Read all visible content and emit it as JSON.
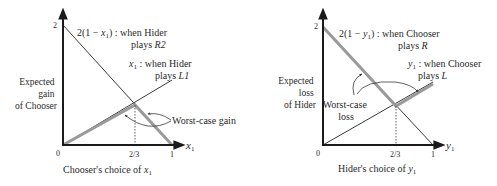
{
  "colors": {
    "axis": "#1a1a1a",
    "thin_line": "#3a3a3a",
    "thick_line": "#9a9a9a",
    "text": "#2a2a2a"
  },
  "left": {
    "ylabel": [
      "Expected",
      "gain",
      "of Chooser"
    ],
    "xlabel_prefix": "Chooser's choice of ",
    "xlabel_var": "x",
    "xlabel_sub": "1",
    "axis_var": "x",
    "axis_sub": "1",
    "tick_y2": "2",
    "tick_0": "0",
    "tick_23": "2/3",
    "tick_1": "1",
    "line_r_label_prefix": "2(1 − ",
    "line_r_label_var": "x",
    "line_r_label_sub": "1",
    "line_r_label_suffix": ") : when Hider",
    "line_r_label_line2_prefix": "plays ",
    "line_r_label_line2_strategy": "R2",
    "line_l_label_var": "x",
    "line_l_label_sub": "1",
    "line_l_label_suffix": " : when Hider",
    "line_l_label_line2_prefix": "plays ",
    "line_l_label_line2_strategy": "L1",
    "annotation": "Worst-case gain"
  },
  "right": {
    "ylabel": [
      "Expected",
      "loss",
      "of Hider"
    ],
    "xlabel_prefix": "Hider's choice of ",
    "xlabel_var": "y",
    "xlabel_sub": "1",
    "axis_var": "y",
    "axis_sub": "1",
    "tick_y2": "2",
    "tick_0": "0",
    "tick_23": "2/3",
    "tick_1": "1",
    "line_r_label_prefix": "2(1 − ",
    "line_r_label_var": "y",
    "line_r_label_sub": "1",
    "line_r_label_suffix": ") : when Chooser",
    "line_r_label_line2_prefix": "plays ",
    "line_r_label_line2_strategy": "R",
    "line_l_label_var": "y",
    "line_l_label_sub": "1",
    "line_l_label_suffix": " : when Chooser",
    "line_l_label_line2_prefix": "plays ",
    "line_l_label_line2_strategy": "L",
    "annotation": [
      "Worst-case",
      "loss"
    ]
  }
}
